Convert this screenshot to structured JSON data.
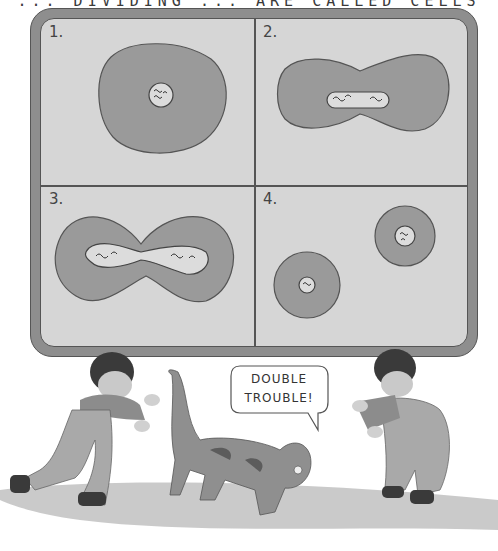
{
  "header": {
    "partial_text": "... DIVIDING ... ARE CALLED CELLS"
  },
  "board": {
    "panels": [
      {
        "label": "1.",
        "stage": "single-cell"
      },
      {
        "label": "2.",
        "stage": "cell-elongating"
      },
      {
        "label": "3.",
        "stage": "cell-pinching"
      },
      {
        "label": "4.",
        "stage": "two-daughter-cells"
      }
    ]
  },
  "speech_bubble": {
    "line1": "DOUBLE",
    "line2": "TROUBLE!"
  },
  "characters": [
    "child-left",
    "cat",
    "child-right"
  ],
  "colors": {
    "board_frame": "#8e8e8e",
    "board_surface": "#d6d6d6",
    "cell": "#9a9a9a",
    "nucleus": "#dcdcdc",
    "outline": "#555555"
  }
}
